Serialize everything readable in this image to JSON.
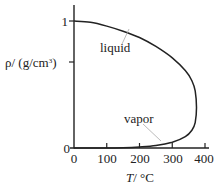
{
  "chart_data": {
    "type": "line",
    "title": "",
    "xlabel_var": "T",
    "xlabel_unit": "/ °C",
    "ylabel_prefix": "ρ/ (g/cm",
    "ylabel_sup": "3",
    "ylabel_suffix": ")",
    "xlim": [
      0,
      400
    ],
    "ylim": [
      0,
      1
    ],
    "xticks": [
      {
        "value": 0,
        "label": "0"
      },
      {
        "value": 100,
        "label": "100"
      },
      {
        "value": 200,
        "label": "200"
      },
      {
        "value": 300,
        "label": "300"
      },
      {
        "value": 400,
        "label": "400"
      }
    ],
    "yticks": [
      {
        "value": 0,
        "label": "0"
      },
      {
        "value": 0.5,
        "label": ""
      },
      {
        "value": 1,
        "label": "1"
      }
    ],
    "grid": false,
    "legend": "none",
    "annotations": [
      {
        "text": "liquid",
        "target": "liquid branch"
      },
      {
        "text": "vapor",
        "target": "vapor branch"
      }
    ],
    "series": [
      {
        "name": "liquid",
        "x": [
          0,
          50,
          100,
          150,
          200,
          250,
          300,
          340,
          360,
          370,
          374
        ],
        "y": [
          1.0,
          0.99,
          0.96,
          0.92,
          0.87,
          0.8,
          0.71,
          0.61,
          0.53,
          0.45,
          0.32
        ]
      },
      {
        "name": "vapor",
        "x": [
          0,
          100,
          150,
          200,
          250,
          300,
          340,
          360,
          370,
          374
        ],
        "y": [
          0.0,
          0.0,
          0.002,
          0.008,
          0.02,
          0.046,
          0.09,
          0.14,
          0.2,
          0.32
        ]
      }
    ]
  }
}
